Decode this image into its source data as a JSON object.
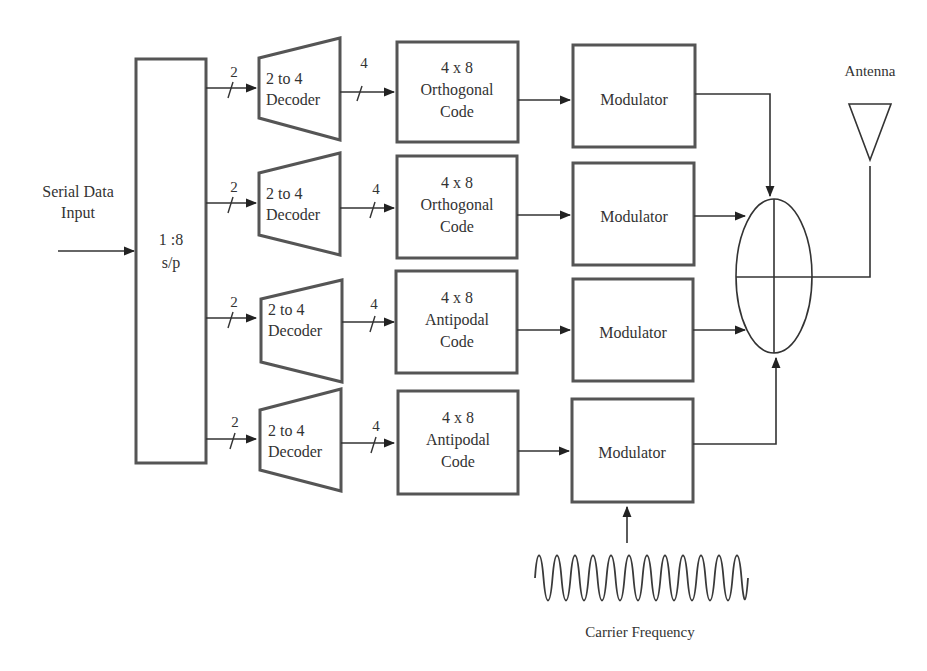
{
  "input": {
    "label_line1": "Serial Data",
    "label_line2": "Input"
  },
  "sp": {
    "line1": "1 :8",
    "line2": "s/p"
  },
  "rows": [
    {
      "bus_in": "2",
      "decoder": {
        "line1": "2 to 4",
        "line2": "Decoder"
      },
      "bus_out": "4",
      "code": {
        "line1": "4 x 8",
        "line2": "Orthogonal",
        "line3": "Code"
      },
      "modulator": "Modulator"
    },
    {
      "bus_in": "2",
      "decoder": {
        "line1": "2 to 4",
        "line2": "Decoder"
      },
      "bus_out": "4",
      "code": {
        "line1": "4 x 8",
        "line2": "Orthogonal",
        "line3": "Code"
      },
      "modulator": "Modulator"
    },
    {
      "bus_in": "2",
      "decoder": {
        "line1": "2 to 4",
        "line2": "Decoder"
      },
      "bus_out": "4",
      "code": {
        "line1": "4 x 8",
        "line2": "Antipodal",
        "line3": "Code"
      },
      "modulator": "Modulator"
    },
    {
      "bus_in": "2",
      "decoder": {
        "line1": "2 to 4",
        "line2": "Decoder"
      },
      "bus_out": "4",
      "code": {
        "line1": "4 x 8",
        "line2": "Antipodal",
        "line3": "Code"
      },
      "modulator": "Modulator"
    }
  ],
  "combiner": {
    "icon": "summing-junction-icon"
  },
  "antenna": {
    "label": "Antenna",
    "icon": "antenna-icon"
  },
  "carrier": {
    "label": "Carrier Frequency",
    "icon": "sine-wave-icon"
  },
  "colors": {
    "stroke": "#555555",
    "line": "#333333",
    "background": "#ffffff"
  }
}
